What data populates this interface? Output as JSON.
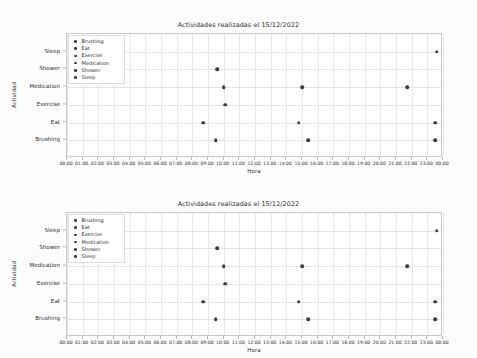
{
  "document": {
    "figure_count": 2
  },
  "chart_data": [
    {
      "type": "scatter",
      "title": "Actividades realizadas el 15/12/2022",
      "xlabel": "Hora",
      "ylabel": "Actividad",
      "grid": true,
      "legend_position": "upper left",
      "categories": [
        "Brushing",
        "Eat",
        "Exercise",
        "Medication",
        "Shower",
        "Sleep"
      ],
      "ytick_labels": [
        "Brushing",
        "Eat",
        "Exercise",
        "Medication",
        "Shower",
        "Sleep"
      ],
      "xtick_labels": [
        "00:00",
        "01:00",
        "02:00",
        "03:00",
        "04:00",
        "05:00",
        "06:00",
        "07:00",
        "08:00",
        "09:00",
        "10:00",
        "11:00",
        "12:00",
        "13:00",
        "14:00",
        "15:00",
        "16:00",
        "17:00",
        "18:00",
        "19:00",
        "20:00",
        "21:00",
        "22:00",
        "23:00",
        "00:00"
      ],
      "xlim": [
        0,
        24
      ],
      "marker_color": "#3b3b42",
      "series": [
        {
          "name": "Brushing",
          "points": [
            {
              "x": 9.5,
              "y": "Brushing",
              "time": "09:30"
            },
            {
              "x": 15.4,
              "y": "Brushing",
              "time": "15:25"
            },
            {
              "x": 23.5,
              "y": "Brushing",
              "time": "23:30"
            }
          ]
        },
        {
          "name": "Eat",
          "points": [
            {
              "x": 8.7,
              "y": "Eat",
              "time": "08:40"
            },
            {
              "x": 14.8,
              "y": "Eat",
              "time": "14:50"
            },
            {
              "x": 23.5,
              "y": "Eat",
              "time": "23:30"
            }
          ]
        },
        {
          "name": "Exercise",
          "points": [
            {
              "x": 10.1,
              "y": "Exercise",
              "time": "10:05"
            }
          ]
        },
        {
          "name": "Medication",
          "points": [
            {
              "x": 10.0,
              "y": "Medication",
              "time": "10:00"
            },
            {
              "x": 15.0,
              "y": "Medication",
              "time": "15:00"
            },
            {
              "x": 21.7,
              "y": "Medication",
              "time": "21:45"
            }
          ]
        },
        {
          "name": "Shower",
          "points": [
            {
              "x": 9.6,
              "y": "Shower",
              "time": "09:35"
            }
          ]
        },
        {
          "name": "Sleep",
          "points": [
            {
              "x": 23.6,
              "y": "Sleep",
              "time": "23:35"
            }
          ]
        }
      ]
    },
    {
      "type": "scatter",
      "title": "Actividades realizadas el 15/12/2022",
      "xlabel": "Hora",
      "ylabel": "Actividad",
      "grid": true,
      "legend_position": "upper left",
      "categories": [
        "Brushing",
        "Eat",
        "Exercise",
        "Medication",
        "Shower",
        "Sleep"
      ],
      "ytick_labels": [
        "Brushing",
        "Eat",
        "Exercise",
        "Medication",
        "Shower",
        "Sleep"
      ],
      "xtick_labels": [
        "00:00",
        "01:00",
        "02:00",
        "03:00",
        "04:00",
        "05:00",
        "06:00",
        "07:00",
        "08:00",
        "09:00",
        "10:00",
        "11:00",
        "12:00",
        "13:00",
        "14:00",
        "15:00",
        "16:00",
        "17:00",
        "18:00",
        "19:00",
        "20:00",
        "21:00",
        "22:00",
        "23:00",
        "00:00"
      ],
      "xlim": [
        0,
        24
      ],
      "marker_color": "#3b3b42",
      "series": [
        {
          "name": "Brushing",
          "points": [
            {
              "x": 9.5,
              "y": "Brushing",
              "time": "09:30"
            },
            {
              "x": 15.4,
              "y": "Brushing",
              "time": "15:25"
            },
            {
              "x": 23.5,
              "y": "Brushing",
              "time": "23:30"
            }
          ]
        },
        {
          "name": "Eat",
          "points": [
            {
              "x": 8.7,
              "y": "Eat",
              "time": "08:40"
            },
            {
              "x": 14.8,
              "y": "Eat",
              "time": "14:50"
            },
            {
              "x": 23.5,
              "y": "Eat",
              "time": "23:30"
            }
          ]
        },
        {
          "name": "Exercise",
          "points": [
            {
              "x": 10.1,
              "y": "Exercise",
              "time": "10:05"
            }
          ]
        },
        {
          "name": "Medication",
          "points": [
            {
              "x": 10.0,
              "y": "Medication",
              "time": "10:00"
            },
            {
              "x": 15.0,
              "y": "Medication",
              "time": "15:00"
            },
            {
              "x": 21.7,
              "y": "Medication",
              "time": "21:45"
            }
          ]
        },
        {
          "name": "Shower",
          "points": [
            {
              "x": 9.6,
              "y": "Shower",
              "time": "09:35"
            }
          ]
        },
        {
          "name": "Sleep",
          "points": [
            {
              "x": 23.6,
              "y": "Sleep",
              "time": "23:35"
            }
          ]
        }
      ]
    }
  ]
}
